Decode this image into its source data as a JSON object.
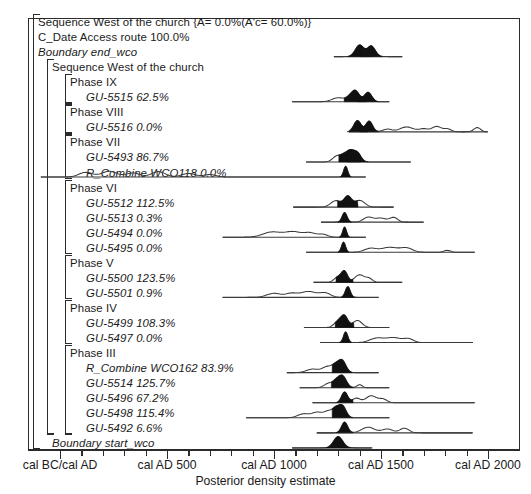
{
  "chart_data": {
    "type": "area",
    "title": "",
    "xlabel": "Posterior density estimate",
    "ylabel": "",
    "xlim": [
      -150,
      2150
    ],
    "grid": false,
    "legend": null,
    "axis_ticks_major": [
      {
        "value": 0,
        "label": "cal BC/cal AD"
      },
      {
        "value": 500,
        "label": "cal AD 500"
      },
      {
        "value": 1000,
        "label": "cal AD 1000"
      },
      {
        "value": 1500,
        "label": "cal AD 1500"
      },
      {
        "value": 2000,
        "label": "cal AD 2000"
      }
    ],
    "axis_ticks_minor": [
      100,
      200,
      300,
      400,
      600,
      700,
      800,
      900,
      1100,
      1200,
      1300,
      1400,
      1600,
      1700,
      1800,
      1900
    ],
    "rows": [
      {
        "id": "seq-top",
        "label": "Sequence West of the church {A=  0.0%(A'c= 60.0%)}",
        "style": "plain",
        "indent": 0,
        "dist": null
      },
      {
        "id": "cdate-access",
        "label": "C_Date Access route  100.0%",
        "style": "plain",
        "indent": 0,
        "dist": null
      },
      {
        "id": "boundary-end",
        "label": "Boundary  end_wco",
        "style": "italic",
        "indent": 0,
        "dist": {
          "range": [
            1280,
            1600
          ],
          "peaks": [
            {
              "c": 1400,
              "w": 28,
              "h": 0.86,
              "fill": true
            },
            {
              "c": 1455,
              "w": 26,
              "h": 0.78,
              "fill": true
            }
          ],
          "tail": []
        }
      },
      {
        "id": "seq-inner",
        "label": "Sequence West of the church",
        "style": "plain",
        "indent": 1,
        "dist": null
      },
      {
        "id": "phase-ix",
        "label": "Phase IX",
        "style": "plain",
        "indent": 2,
        "dist": null
      },
      {
        "id": "gu-5515",
        "label": "GU-5515   62.5%",
        "style": "italic",
        "indent": 3,
        "dist": {
          "range": [
            1085,
            1540
          ],
          "peaks": [
            {
              "c": 1380,
              "w": 26,
              "h": 0.82,
              "fill": true
            },
            {
              "c": 1440,
              "w": 24,
              "h": 0.7,
              "fill": true
            }
          ],
          "tail": [
            {
              "c": 1300,
              "w": 40,
              "h": 0.3
            },
            {
              "c": 1350,
              "w": 22,
              "h": 0.22
            }
          ]
        }
      },
      {
        "id": "phase-viii",
        "label": "Phase VIII",
        "style": "plain",
        "indent": 2,
        "dist": null
      },
      {
        "id": "gu-5516",
        "label": "GU-5516    0.0%",
        "style": "italic",
        "indent": 3,
        "dist": {
          "range": [
            1350,
            2000
          ],
          "peaks": [
            {
              "c": 1390,
              "w": 24,
              "h": 0.84,
              "fill": true
            },
            {
              "c": 1445,
              "w": 22,
              "h": 0.8,
              "fill": true
            }
          ],
          "tail": [
            {
              "c": 1530,
              "w": 30,
              "h": 0.2
            },
            {
              "c": 1620,
              "w": 45,
              "h": 0.36
            },
            {
              "c": 1700,
              "w": 30,
              "h": 0.22
            },
            {
              "c": 1760,
              "w": 30,
              "h": 0.4
            },
            {
              "c": 1810,
              "w": 25,
              "h": 0.22
            },
            {
              "c": 1950,
              "w": 22,
              "h": 0.32
            }
          ]
        }
      },
      {
        "id": "phase-vii",
        "label": "Phase VII",
        "style": "plain",
        "indent": 2,
        "dist": null
      },
      {
        "id": "gu-5493",
        "label": "GU-5493   86.7%",
        "style": "italic",
        "indent": 3,
        "dist": {
          "range": [
            1150,
            1640
          ],
          "peaks": [
            {
              "c": 1355,
              "w": 26,
              "h": 0.8,
              "fill": true
            },
            {
              "c": 1390,
              "w": 24,
              "h": 0.62,
              "fill": true
            }
          ],
          "tail": [
            {
              "c": 1295,
              "w": 28,
              "h": 0.45
            },
            {
              "c": 1325,
              "w": 20,
              "h": 0.3
            }
          ]
        }
      },
      {
        "id": "rcombine-wco118",
        "label": "R_Combine WCO118   0.0%",
        "style": "italic",
        "indent": 3,
        "dist": {
          "range": [
            -90,
            1430
          ],
          "peaks": [
            {
              "c": 1335,
              "w": 13,
              "h": 0.8,
              "fill": true
            }
          ],
          "tail": [
            {
              "c": 120,
              "w": 45,
              "h": 0.34
            },
            {
              "c": 230,
              "w": 50,
              "h": 0.42
            },
            {
              "c": 340,
              "w": 45,
              "h": 0.3
            },
            {
              "c": 460,
              "w": 45,
              "h": 0.4
            },
            {
              "c": 600,
              "w": 45,
              "h": 0.26
            },
            {
              "c": 700,
              "w": 40,
              "h": 0.18
            }
          ]
        }
      },
      {
        "id": "phase-vi",
        "label": "Phase VI",
        "style": "plain",
        "indent": 2,
        "dist": null
      },
      {
        "id": "gu-5512",
        "label": "GU-5512  112.5%",
        "style": "italic",
        "indent": 3,
        "dist": {
          "range": [
            1090,
            1560
          ],
          "peaks": [
            {
              "c": 1345,
              "w": 24,
              "h": 0.78,
              "fill": true
            }
          ],
          "tail": [
            {
              "c": 1290,
              "w": 34,
              "h": 0.48
            },
            {
              "c": 1400,
              "w": 34,
              "h": 0.5
            }
          ]
        }
      },
      {
        "id": "gu-5513",
        "label": "GU-5513    0.3%",
        "style": "italic",
        "indent": 3,
        "dist": {
          "range": [
            1220,
            1700
          ],
          "peaks": [
            {
              "c": 1330,
              "w": 16,
              "h": 0.72,
              "fill": true
            }
          ],
          "tail": [
            {
              "c": 1440,
              "w": 32,
              "h": 0.36
            },
            {
              "c": 1500,
              "w": 36,
              "h": 0.3
            },
            {
              "c": 1560,
              "w": 26,
              "h": 0.34
            }
          ]
        }
      },
      {
        "id": "gu-5494",
        "label": "GU-5494    0.0%",
        "style": "italic",
        "indent": 3,
        "dist": {
          "range": [
            760,
            1430
          ],
          "peaks": [
            {
              "c": 1330,
              "w": 12,
              "h": 0.76,
              "fill": true
            }
          ],
          "tail": [
            {
              "c": 990,
              "w": 60,
              "h": 0.38
            },
            {
              "c": 1090,
              "w": 55,
              "h": 0.4
            },
            {
              "c": 1170,
              "w": 40,
              "h": 0.3
            },
            {
              "c": 1230,
              "w": 30,
              "h": 0.2
            }
          ]
        }
      },
      {
        "id": "gu-5495",
        "label": "GU-5495    0.0%",
        "style": "italic",
        "indent": 3,
        "dist": {
          "range": [
            1150,
            1940
          ],
          "peaks": [
            {
              "c": 1325,
              "w": 13,
              "h": 0.76,
              "fill": true
            }
          ],
          "tail": [
            {
              "c": 1450,
              "w": 40,
              "h": 0.28
            },
            {
              "c": 1540,
              "w": 55,
              "h": 0.36
            },
            {
              "c": 1620,
              "w": 40,
              "h": 0.3
            },
            {
              "c": 1810,
              "w": 22,
              "h": 0.14
            }
          ]
        }
      },
      {
        "id": "phase-v",
        "label": "Phase V",
        "style": "plain",
        "indent": 2,
        "dist": null
      },
      {
        "id": "gu-5500",
        "label": "GU-5500  123.5%",
        "style": "italic",
        "indent": 3,
        "dist": {
          "range": [
            1185,
            1600
          ],
          "peaks": [
            {
              "c": 1330,
              "w": 20,
              "h": 0.76,
              "fill": true
            }
          ],
          "tail": [
            {
              "c": 1300,
              "w": 26,
              "h": 0.4
            },
            {
              "c": 1400,
              "w": 32,
              "h": 0.56
            },
            {
              "c": 1445,
              "w": 22,
              "h": 0.26
            }
          ]
        }
      },
      {
        "id": "gu-5501",
        "label": "GU-5501    0.9%",
        "style": "italic",
        "indent": 3,
        "dist": {
          "range": [
            760,
            1490
          ],
          "peaks": [
            {
              "c": 1345,
              "w": 16,
              "h": 0.8,
              "fill": true
            }
          ],
          "tail": [
            {
              "c": 1000,
              "w": 48,
              "h": 0.3
            },
            {
              "c": 1080,
              "w": 36,
              "h": 0.26
            },
            {
              "c": 1160,
              "w": 55,
              "h": 0.44
            },
            {
              "c": 1240,
              "w": 36,
              "h": 0.3
            }
          ]
        }
      },
      {
        "id": "phase-iv",
        "label": "Phase IV",
        "style": "plain",
        "indent": 2,
        "dist": null
      },
      {
        "id": "gu-5499",
        "label": "GU-5499  108.3%",
        "style": "italic",
        "indent": 3,
        "dist": {
          "range": [
            1140,
            1540
          ],
          "peaks": [
            {
              "c": 1330,
              "w": 22,
              "h": 0.8,
              "fill": true
            }
          ],
          "tail": [
            {
              "c": 1300,
              "w": 26,
              "h": 0.46
            },
            {
              "c": 1390,
              "w": 30,
              "h": 0.52
            }
          ]
        }
      },
      {
        "id": "gu-5497",
        "label": "GU-5497    0.0%",
        "style": "italic",
        "indent": 3,
        "dist": {
          "range": [
            1215,
            1930
          ],
          "peaks": [
            {
              "c": 1335,
              "w": 14,
              "h": 0.8,
              "fill": true
            }
          ],
          "tail": [
            {
              "c": 1480,
              "w": 45,
              "h": 0.32
            },
            {
              "c": 1560,
              "w": 50,
              "h": 0.36
            },
            {
              "c": 1630,
              "w": 32,
              "h": 0.26
            }
          ]
        }
      },
      {
        "id": "phase-iii",
        "label": "Phase III",
        "style": "plain",
        "indent": 2,
        "dist": null
      },
      {
        "id": "rcombine-wco162",
        "label": "R_Combine WCO162   83.9%",
        "style": "italic",
        "indent": 3,
        "dist": {
          "range": [
            1060,
            1490
          ],
          "peaks": [
            {
              "c": 1320,
              "w": 24,
              "h": 0.84,
              "fill": true
            }
          ],
          "tail": [
            {
              "c": 1180,
              "w": 40,
              "h": 0.26
            },
            {
              "c": 1250,
              "w": 34,
              "h": 0.44
            },
            {
              "c": 1290,
              "w": 24,
              "h": 0.5
            }
          ]
        }
      },
      {
        "id": "gu-5514",
        "label": "GU-5514  125.7%",
        "style": "italic",
        "indent": 3,
        "dist": {
          "range": [
            1120,
            1540
          ],
          "peaks": [
            {
              "c": 1320,
              "w": 26,
              "h": 0.86,
              "fill": true
            }
          ],
          "tail": [
            {
              "c": 1255,
              "w": 28,
              "h": 0.32
            },
            {
              "c": 1290,
              "w": 22,
              "h": 0.4
            },
            {
              "c": 1400,
              "w": 18,
              "h": 0.22
            }
          ]
        }
      },
      {
        "id": "gu-5496",
        "label": "GU-5496   67.2%",
        "style": "italic",
        "indent": 3,
        "dist": {
          "range": [
            1180,
            1940
          ],
          "peaks": [
            {
              "c": 1330,
              "w": 20,
              "h": 0.8,
              "fill": true
            }
          ],
          "tail": [
            {
              "c": 1385,
              "w": 26,
              "h": 0.34
            },
            {
              "c": 1455,
              "w": 35,
              "h": 0.52
            },
            {
              "c": 1510,
              "w": 26,
              "h": 0.26
            }
          ]
        }
      },
      {
        "id": "gu-5498",
        "label": "GU-5498  115.4%",
        "style": "italic",
        "indent": 3,
        "dist": {
          "range": [
            870,
            1540
          ],
          "peaks": [
            {
              "c": 1320,
              "w": 24,
              "h": 0.86,
              "fill": true
            }
          ],
          "tail": [
            {
              "c": 1140,
              "w": 40,
              "h": 0.3
            },
            {
              "c": 1200,
              "w": 30,
              "h": 0.36
            },
            {
              "c": 1255,
              "w": 34,
              "h": 0.5
            },
            {
              "c": 1290,
              "w": 22,
              "h": 0.52
            }
          ]
        }
      },
      {
        "id": "gu-5492",
        "label": "GU-5492    6.6%",
        "style": "italic",
        "indent": 3,
        "dist": {
          "range": [
            1200,
            1930
          ],
          "peaks": [
            {
              "c": 1330,
              "w": 20,
              "h": 0.8,
              "fill": true
            }
          ],
          "tail": [
            {
              "c": 1440,
              "w": 42,
              "h": 0.42
            },
            {
              "c": 1530,
              "w": 36,
              "h": 0.28
            },
            {
              "c": 1610,
              "w": 30,
              "h": 0.34
            }
          ]
        }
      },
      {
        "id": "boundary-start",
        "label": "Boundary start_wco",
        "style": "italic",
        "indent": 1,
        "dist": {
          "range": [
            1085,
            1460
          ],
          "peaks": [
            {
              "c": 1300,
              "w": 30,
              "h": 0.84,
              "fill": true
            }
          ],
          "tail": []
        }
      }
    ]
  }
}
